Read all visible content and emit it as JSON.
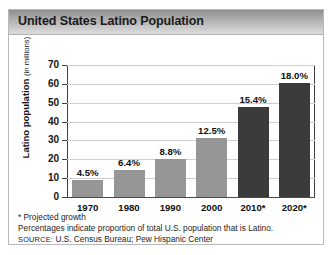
{
  "figure": {
    "title": "United States Latino Population",
    "footnotes": [
      "* Projected growth",
      "Percentages indicate proportion of total U.S. population that is Latino."
    ],
    "source_label": "Source:",
    "source_text": "U.S. Census Bureau; Pew Hispanic Center"
  },
  "colors": {
    "bar_light": "#969696",
    "bar_dark": "#3b3b3b",
    "gridline": "#cfcfcf",
    "axis": "#3f3f3f",
    "title_bar_top": "#8f8f8f",
    "title_bar_bottom": "#dcdcdc"
  },
  "chart_data": {
    "type": "bar",
    "title": "United States Latino Population",
    "xlabel": "",
    "ylabel": "Latino population (in millions)",
    "ylabel_main": "Latino population",
    "ylabel_unit": "(in millions)",
    "ylim": [
      0,
      70
    ],
    "yticks": [
      0,
      10,
      20,
      30,
      40,
      50,
      60,
      70
    ],
    "ytick_labels": [
      "0",
      "10",
      "20",
      "30",
      "40",
      "50",
      "60",
      "70"
    ],
    "grid": true,
    "legend": false,
    "categories": [
      "1970",
      "1980",
      "1990",
      "2000",
      "2010*",
      "2020*"
    ],
    "values": [
      9.1,
      14.1,
      20.0,
      31.2,
      47.8,
      60.4
    ],
    "point_labels": [
      "4.5%",
      "6.4%",
      "8.8%",
      "12.5%",
      "15.4%",
      "18.0%"
    ],
    "bar_styles": [
      "light",
      "light",
      "light",
      "light",
      "dark",
      "dark"
    ],
    "annotations": [
      "* Projected growth",
      "Percentages indicate proportion of total U.S. population that is Latino.",
      "SOURCE: U.S. Census Bureau; Pew Hispanic Center"
    ]
  }
}
